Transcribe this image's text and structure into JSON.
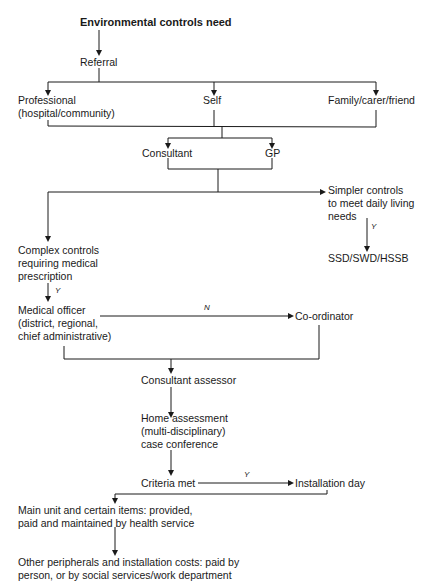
{
  "diagram": {
    "title": "Environmental controls need",
    "nodes": {
      "referral": "Referral",
      "professional": [
        "Professional",
        "(hospital/community)"
      ],
      "self": "Self",
      "family": "Family/carer/friend",
      "consultant": "Consultant",
      "gp": "GP",
      "simpler": [
        "Simpler controls",
        "to meet daily living",
        "needs"
      ],
      "ssd": "SSD/SWD/HSSB",
      "complex": [
        "Complex controls",
        "requiring medical",
        "prescription"
      ],
      "medical_officer": [
        "Medical officer",
        "(district, regional,",
        "chief administrative)"
      ],
      "coordinator": "Co-ordinator",
      "consultant_assessor": "Consultant assessor",
      "home_assessment": [
        "Home assessment",
        "(multi-disciplinary)",
        "case conference"
      ],
      "criteria_met": "Criteria met",
      "installation_day": "Installation day",
      "main_unit": [
        "Main unit and certain items:  provided,",
        "paid and maintained by health service"
      ],
      "other_peripherals": [
        "Other peripherals and installation costs:  paid by",
        "person, or by social services/work department"
      ]
    },
    "edge_labels": {
      "simpler_yes": "Y",
      "complex_yes": "Y",
      "medical_no": "N",
      "criteria_yes": "Y"
    }
  }
}
